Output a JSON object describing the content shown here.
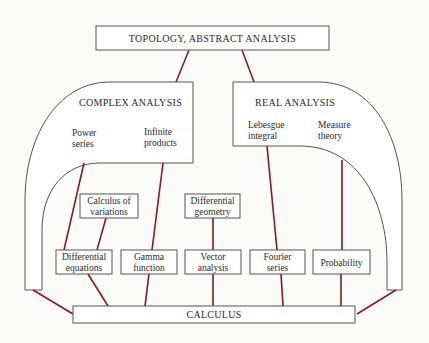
{
  "diagram": {
    "colors": {
      "link": "#8b1a1a",
      "stroke": "#555555",
      "background": "#fbfbf9"
    },
    "top": {
      "label": "TOPOLOGY, ABSTRACT ANALYSIS"
    },
    "complex": {
      "label": "COMPLEX ANALYSIS",
      "items": [
        {
          "line1": "Power",
          "line2": "series"
        },
        {
          "line1": "Infinite",
          "line2": "products"
        }
      ]
    },
    "real": {
      "label": "REAL ANALYSIS",
      "items": [
        {
          "line1": "Lebesgue",
          "line2": "integral"
        },
        {
          "line1": "Measure",
          "line2": "theory"
        }
      ]
    },
    "middle": [
      {
        "line1": "Calculus of",
        "line2": "variations"
      },
      {
        "line1": "Differential",
        "line2": "geometry"
      }
    ],
    "lower": [
      {
        "line1": "Differential",
        "line2": "equations"
      },
      {
        "line1": "Gamma",
        "line2": "function"
      },
      {
        "line1": "Vector",
        "line2": "analysis"
      },
      {
        "line1": "Fourier",
        "line2": "series"
      },
      {
        "line1": "Probability"
      }
    ],
    "bottom": {
      "label": "CALCULUS"
    }
  }
}
